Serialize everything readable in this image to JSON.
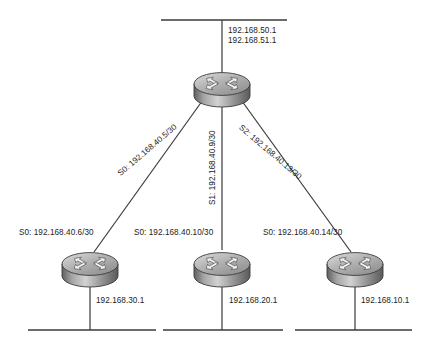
{
  "diagram": {
    "colors": {
      "line": "#3a3a3a",
      "text": "#232323",
      "router_top_light": "#d9d9d9",
      "router_top_dark": "#8a8a8a",
      "router_side_light": "#c9c9c9",
      "router_side_dark": "#6d6d6d",
      "router_outline": "#3c3c3c",
      "arrow_fill": "#efefef",
      "arrow_stroke": "#555555"
    },
    "top_lan": {
      "addresses": [
        "192.168.50.1",
        "192.168.51.1"
      ]
    },
    "link_labels": [
      {
        "name": "serial-0-link",
        "text": "S0: 192.168.40.5/30",
        "angle": -40.5
      },
      {
        "name": "serial-1-link",
        "text": "S1: 192.168.40.9/30",
        "angle": -90
      },
      {
        "name": "serial-2-link",
        "text": "S2: 192.168.40.13/30",
        "angle": 40.5
      }
    ],
    "branches": [
      {
        "id": "left",
        "interface_label": "S0: 192.168.40.6/30",
        "lan_address": "192.168.30.1"
      },
      {
        "id": "center",
        "interface_label": "S0: 192.168.40.10/30",
        "lan_address": "192.168.20.1"
      },
      {
        "id": "right",
        "interface_label": "S0: 192.168.40.14/30",
        "lan_address": "192.168.10.1"
      }
    ],
    "routers": [
      {
        "id": "core-router",
        "role": "hub"
      },
      {
        "id": "branch-router-left",
        "role": "spoke"
      },
      {
        "id": "branch-router-center",
        "role": "spoke"
      },
      {
        "id": "branch-router-right",
        "role": "spoke"
      }
    ]
  }
}
